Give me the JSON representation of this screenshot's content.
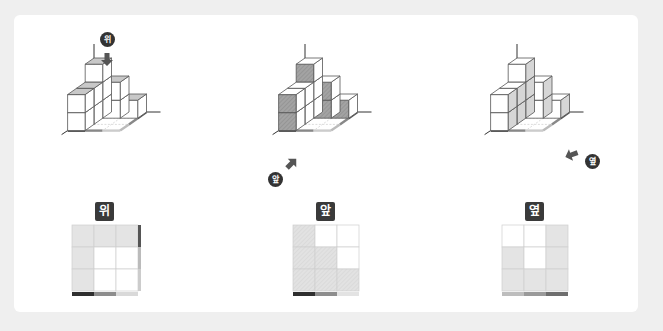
{
  "views": [
    {
      "id": "top",
      "label": "위",
      "direction_label": "위",
      "arrow": "down",
      "grid": {
        "rows": 3,
        "cols": 3,
        "filled": [
          [
            1,
            1,
            1
          ],
          [
            1,
            0,
            0
          ],
          [
            1,
            0,
            0
          ]
        ],
        "bottom_bar": [
          "#2f2f2f",
          "#8d8d8d",
          "#d9d9d9"
        ],
        "right_bar": [
          "#555555",
          "#bbbbbb",
          "#cccccc"
        ]
      }
    },
    {
      "id": "front",
      "label": "앞",
      "direction_label": "앞",
      "arrow": "up-right",
      "grid": {
        "rows": 3,
        "cols": 3,
        "filled": [
          [
            1,
            0,
            0
          ],
          [
            1,
            1,
            0
          ],
          [
            1,
            1,
            1
          ]
        ],
        "bottom_bar": [
          "#2f2f2f",
          "#8d8d8d",
          "#e3e3e3"
        ]
      }
    },
    {
      "id": "side",
      "label": "옆",
      "direction_label": "옆",
      "arrow": "left",
      "grid": {
        "rows": 3,
        "cols": 3,
        "filled": [
          [
            0,
            0,
            1
          ],
          [
            1,
            0,
            1
          ],
          [
            1,
            1,
            1
          ]
        ],
        "bottom_bar": [
          "#bdbdbd",
          "#9a9a9a",
          "#6e6e6e"
        ]
      }
    }
  ],
  "colors": {
    "background": "#efefef",
    "card": "#ffffff",
    "cube_edge": "#555555",
    "cube_face": "#ffffff",
    "highlight_top": "#c8c8c8",
    "highlight_front": "#9a9a9a",
    "highlight_side": "#d6d6d6",
    "grid_fill": "#e4e4e4",
    "grid_line": "#cfcfcf",
    "badge": "#3a3a3a"
  }
}
